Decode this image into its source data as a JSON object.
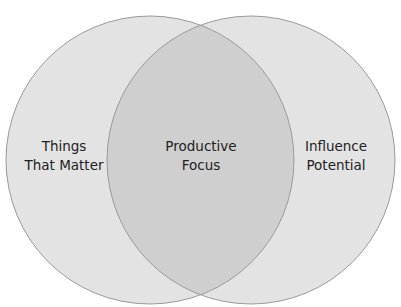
{
  "diagram": {
    "type": "venn",
    "circles": [
      {
        "id": "left",
        "label_line1": "Things",
        "label_line2": "That Matter",
        "cx": 150,
        "cy": 160,
        "r": 144
      },
      {
        "id": "right",
        "label_line1": "Influence",
        "label_line2": "Potential",
        "cx": 251,
        "cy": 160,
        "r": 144
      }
    ],
    "overlap": {
      "label_line1": "Productive",
      "label_line2": "Focus"
    },
    "colors": {
      "background": "#ffffff",
      "circle_fill": "#e3e3e3",
      "overlap_fill": "#cfcfcf",
      "stroke": "#9a9a9a",
      "text": "#222222"
    }
  }
}
